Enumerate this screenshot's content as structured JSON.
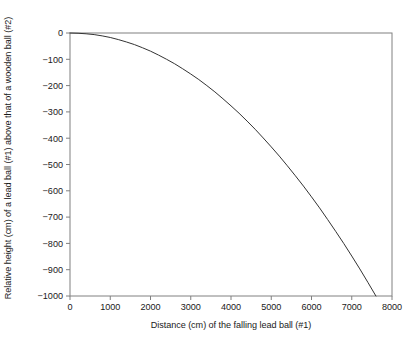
{
  "chart_data": {
    "type": "line",
    "title": "",
    "subtitle": "",
    "xlabel": "Distance (cm) of the falling lead ball (#1)",
    "ylabel": "Relative height (cm) of a lead ball (#1) above that of a wooden ball (#2)",
    "xlim": [
      0,
      8000
    ],
    "ylim": [
      -1000,
      0
    ],
    "xticks": [
      0,
      1000,
      2000,
      3000,
      4000,
      5000,
      6000,
      7000,
      8000
    ],
    "xtick_labels": [
      "0",
      "1000",
      "2000",
      "3000",
      "4000",
      "5000",
      "6000",
      "7000",
      "8000"
    ],
    "yticks": [
      0,
      -100,
      -200,
      -300,
      -400,
      -500,
      -600,
      -700,
      -800,
      -900,
      -1000
    ],
    "ytick_labels": [
      "0",
      "−100",
      "−200",
      "−300",
      "−400",
      "−500",
      "−600",
      "−700",
      "−800",
      "−900",
      "−1000"
    ],
    "grid": false,
    "legend": false,
    "legend_position": "none",
    "series": [
      {
        "name": "Relative height of lead ball above wooden ball",
        "color": "#333333",
        "line_width": 1,
        "x": [
          0,
          200,
          400,
          600,
          800,
          1000,
          1200,
          1400,
          1600,
          1800,
          2000,
          2200,
          2400,
          2600,
          2800,
          3000,
          3200,
          3400,
          3600,
          3800,
          4000,
          4200,
          4400,
          4600,
          4800,
          5000,
          5200,
          5400,
          5600,
          5800,
          6000,
          6200,
          6400,
          6600,
          6800,
          7000,
          7200,
          7400,
          7600
        ],
        "y": [
          0,
          -1,
          -3,
          -6,
          -11,
          -17,
          -25,
          -34,
          -44,
          -56,
          -69,
          -84,
          -100,
          -117,
          -136,
          -156,
          -177,
          -200,
          -224,
          -250,
          -277,
          -305,
          -335,
          -366,
          -399,
          -433,
          -468,
          -505,
          -543,
          -582,
          -623,
          -665,
          -709,
          -754,
          -800,
          -848,
          -897,
          -948,
          -1000
        ]
      }
    ],
    "model": {
      "relation": "quadratic",
      "formula": "y = -1000 * (x / 7600)^2",
      "x_at_minus_1000": 7600
    },
    "axis": {
      "box": true,
      "box_color": "#808080",
      "tick_color": "#808080",
      "background": "#ffffff"
    }
  }
}
